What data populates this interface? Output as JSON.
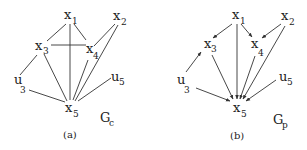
{
  "figure": {
    "panels": [
      {
        "id": "a",
        "caption": "(a)",
        "graph_label": "G",
        "graph_label_sub": "c",
        "directed": false,
        "nodes": [
          {
            "id": "x1",
            "base": "x",
            "sub": "1"
          },
          {
            "id": "x2",
            "base": "x",
            "sub": "2"
          },
          {
            "id": "x3",
            "base": "x",
            "sub": "3"
          },
          {
            "id": "x4",
            "base": "x",
            "sub": "4"
          },
          {
            "id": "x5",
            "base": "x",
            "sub": "5"
          },
          {
            "id": "u3",
            "base": "u",
            "sub": "3"
          },
          {
            "id": "u5",
            "base": "u",
            "sub": "5"
          }
        ],
        "edges": [
          [
            "x1",
            "x3"
          ],
          [
            "x1",
            "x4"
          ],
          [
            "x1",
            "x5"
          ],
          [
            "x3",
            "x4"
          ],
          [
            "x2",
            "x4"
          ],
          [
            "x2",
            "x5"
          ],
          [
            "x3",
            "x5"
          ],
          [
            "x4",
            "x5"
          ],
          [
            "x3",
            "u3"
          ],
          [
            "u3",
            "x5"
          ],
          [
            "u5",
            "x5"
          ]
        ]
      },
      {
        "id": "b",
        "caption": "(b)",
        "graph_label": "G",
        "graph_label_sub": "p",
        "directed": true,
        "nodes": [
          {
            "id": "x1",
            "base": "x",
            "sub": "1"
          },
          {
            "id": "x2",
            "base": "x",
            "sub": "2"
          },
          {
            "id": "x3",
            "base": "x",
            "sub": "3"
          },
          {
            "id": "x4",
            "base": "x",
            "sub": "4"
          },
          {
            "id": "x5",
            "base": "x",
            "sub": "5"
          },
          {
            "id": "u3",
            "base": "u",
            "sub": "3"
          },
          {
            "id": "u5",
            "base": "u",
            "sub": "5"
          }
        ],
        "edges": [
          [
            "x1",
            "x3"
          ],
          [
            "x1",
            "x4"
          ],
          [
            "x1",
            "x5"
          ],
          [
            "x2",
            "x4"
          ],
          [
            "x2",
            "x5"
          ],
          [
            "x3",
            "x5"
          ],
          [
            "x4",
            "x5"
          ],
          [
            "u3",
            "x3"
          ],
          [
            "u3",
            "x5"
          ],
          [
            "u5",
            "x5"
          ]
        ]
      }
    ]
  }
}
